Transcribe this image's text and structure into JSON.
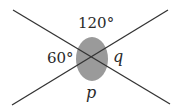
{
  "diagram": {
    "type": "intersecting-lines-angles",
    "colors": {
      "background": "#ffffff",
      "line": "#333333",
      "angle_fill": "#9a9a9a",
      "text": "#2a2a2a"
    },
    "intersection": {
      "x": 92,
      "y": 58
    },
    "angle_marker": {
      "rx": 16,
      "ry": 22
    },
    "lines": [
      {
        "name": "line-a",
        "x1": 13,
        "y1": 10,
        "x2": 170,
        "y2": 104
      },
      {
        "name": "line-b",
        "x1": 12,
        "y1": 105,
        "x2": 168,
        "y2": 10
      }
    ],
    "labels": {
      "top": "120°",
      "left": "60°",
      "right": "q",
      "bottom": "p"
    }
  }
}
